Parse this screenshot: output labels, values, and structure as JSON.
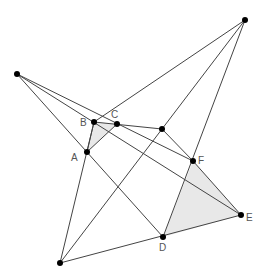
{
  "diagram": {
    "colors": {
      "line": "#444444",
      "point": "#000000",
      "fill": "#e8e8e8",
      "label": "#555555"
    },
    "points": {
      "P1": {
        "x": 17,
        "y": 74,
        "label": ""
      },
      "P2": {
        "x": 245,
        "y": 20,
        "label": ""
      },
      "P3": {
        "x": 60,
        "y": 263,
        "label": ""
      },
      "A": {
        "x": 87,
        "y": 152,
        "label": "A"
      },
      "B": {
        "x": 94,
        "y": 122,
        "label": "B"
      },
      "C": {
        "x": 117,
        "y": 124,
        "label": "C"
      },
      "G": {
        "x": 162,
        "y": 129,
        "label": ""
      },
      "D": {
        "x": 163,
        "y": 237,
        "label": "D"
      },
      "E": {
        "x": 241,
        "y": 215,
        "label": "E"
      },
      "F": {
        "x": 193,
        "y": 161,
        "label": "F"
      }
    },
    "labels": {
      "A": "A",
      "B": "B",
      "C": "C",
      "D": "D",
      "E": "E",
      "F": "F"
    }
  }
}
